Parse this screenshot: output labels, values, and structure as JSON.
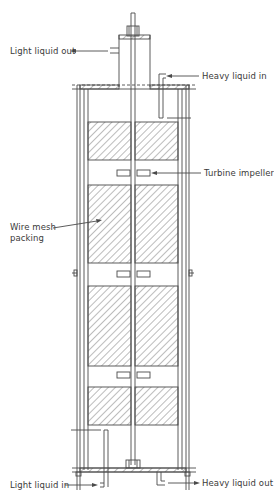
{
  "diagram": {
    "type": "process-equipment-schematic",
    "colors": {
      "line": "#4a4a4a",
      "hatch": "#6a6a6a",
      "background": "#ffffff",
      "text": "#3a3a3a"
    },
    "labels": {
      "light_liquid_out": "Light liquid out",
      "heavy_liquid_in": "Heavy liquid in",
      "turbine_impeller": "Turbine impeller",
      "wire_mesh_packing_line1": "Wire mesh",
      "wire_mesh_packing_line2": "packing",
      "light_liquid_in": "Light liquid in",
      "heavy_liquid_out": "Heavy liquid out"
    },
    "components": [
      {
        "name": "central-shaft",
        "description": "Vertical agitator shaft running full height"
      },
      {
        "name": "top-settling-chamber",
        "description": "Small chamber on top with light liquid outlet"
      },
      {
        "name": "column-shell",
        "description": "Double-walled cylindrical shell"
      },
      {
        "name": "packing-sections",
        "count": 4
      },
      {
        "name": "turbine-impellers",
        "count": 3
      },
      {
        "name": "heavy-liquid-inlet-pipe",
        "position": "top-right"
      },
      {
        "name": "light-liquid-inlet-pipe",
        "position": "bottom-left"
      },
      {
        "name": "heavy-liquid-outlet-pipe",
        "position": "bottom-right"
      }
    ]
  }
}
